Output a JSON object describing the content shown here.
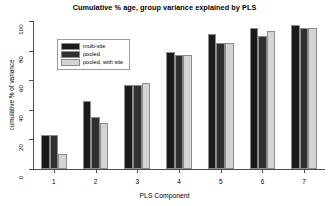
{
  "chart_data": {
    "type": "bar",
    "title": "Cumulative % age, group variance explained by PLS",
    "xlabel": "PLS Component",
    "ylabel": "cumulative % of variance",
    "categories": [
      "1",
      "2",
      "3",
      "4",
      "5",
      "6",
      "7"
    ],
    "ylim": [
      0,
      100
    ],
    "yticks": [
      0,
      20,
      40,
      60,
      80,
      100
    ],
    "grid": false,
    "legend_position": "top-left",
    "series": [
      {
        "name": "multi-site",
        "color": "#1a1a1a",
        "values": [
          23,
          46,
          57,
          79,
          91,
          95,
          97
        ]
      },
      {
        "name": "pooled",
        "color": "#303030",
        "values": [
          23,
          35,
          57,
          77,
          85,
          90,
          95
        ]
      },
      {
        "name": "pooled, with site",
        "color": "#d4d4d4",
        "values": [
          10,
          31,
          58,
          77,
          85,
          93,
          95
        ]
      }
    ]
  },
  "axis": {
    "ytick_labels": [
      "0",
      "20",
      "40",
      "60",
      "80",
      "100"
    ],
    "xtick_labels": [
      "1",
      "2",
      "3",
      "4",
      "5",
      "6",
      "7"
    ]
  },
  "legend": {
    "items": [
      {
        "label": "multi-site",
        "color": "#1a1a1a"
      },
      {
        "label": "pooled",
        "color": "#303030"
      },
      {
        "label": "pooled, with site",
        "color": "#d4d4d4"
      }
    ]
  },
  "colors": {
    "background": "#ffffff",
    "axis": "#4d4d4d",
    "bar_border": "#8c8c8c",
    "text": "#000000"
  }
}
